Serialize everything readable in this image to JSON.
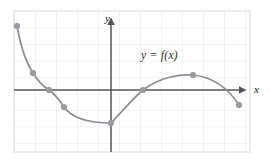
{
  "figure": {
    "background_color": "#ffffff",
    "grid": {
      "visible": true,
      "left": 14,
      "top": 11,
      "right": 250,
      "bottom": 152,
      "cell_width": 21,
      "cell_height": 16.5,
      "line_color": "#e2e2e8",
      "border_color": "#d8d8e0"
    },
    "axes": {
      "color": "#555555",
      "x_axis_y": 90,
      "y_axis_x": 111,
      "x_label": "x",
      "y_label": "y",
      "x_arrow": true,
      "y_arrow": true
    },
    "curve_label": "y = f(x)"
  },
  "chart_data": {
    "type": "line",
    "title": "",
    "xlabel": "x",
    "ylabel": "y",
    "annotations": [
      "y = f(x)"
    ],
    "grid": true,
    "legend": false,
    "axis_origin_px": [
      111,
      90
    ],
    "px_per_unit": [
      21,
      16.5
    ],
    "xlim_px": [
      14,
      250
    ],
    "ylim_px": [
      11,
      152
    ],
    "series": [
      {
        "name": "f(x)",
        "color": "#8c8c94",
        "marker": "circle",
        "marker_color": "#9a9aa2",
        "points_px": [
          [
            17,
            26
          ],
          [
            33,
            73
          ],
          [
            49,
            90
          ],
          [
            64,
            107
          ],
          [
            111,
            123
          ],
          [
            143,
            90
          ],
          [
            193,
            75
          ],
          [
            239,
            105
          ]
        ],
        "points_units": [
          [
            -4.48,
            3.88
          ],
          [
            -3.71,
            1.03
          ],
          [
            -2.95,
            0.0
          ],
          [
            -2.24,
            -1.03
          ],
          [
            0.0,
            -2.0
          ],
          [
            1.52,
            0.0
          ],
          [
            3.9,
            0.91
          ],
          [
            6.1,
            -0.91
          ]
        ],
        "path_d": "M 17 26 C 21 48, 27 64, 33 73 C 40 84, 44 87, 49 90 C 55 94, 60 101, 64 107 C 74 121, 94 123, 111 123 L 111 123 C 122 112, 133 98, 143 90 C 160 77, 180 74, 193 75 C 212 77, 228 88, 239 105",
        "shape_description": "Steeply decreasing convex branch from upper-left to a corner minimum on the y-axis, then an increasing concave branch rising through the x-axis to a local maximum, then decreasing to the lower right."
      }
    ]
  }
}
